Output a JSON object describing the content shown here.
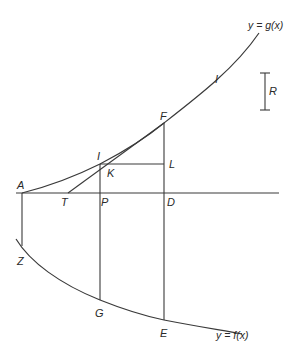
{
  "diagram": {
    "curves": {
      "g": {
        "label": "y = g(x)"
      },
      "f": {
        "label": "y = f(x)"
      }
    },
    "points": {
      "A": "A",
      "T": "T",
      "P": "P",
      "D": "D",
      "F": "F",
      "I_lower": "I",
      "I_upper": "I",
      "K": "K",
      "L": "L",
      "Z": "Z",
      "G": "G",
      "E": "E"
    },
    "scale_bar": {
      "label": "R"
    },
    "colors": {
      "line": "#3a3a3a",
      "text": "#2a2a2a",
      "background": "#ffffff"
    }
  }
}
